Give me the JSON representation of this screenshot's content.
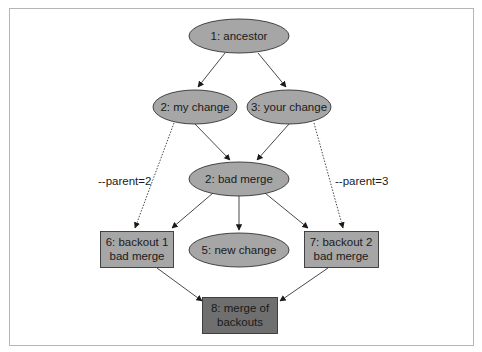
{
  "diagram": {
    "colors": {
      "node_fill": "#a6a6a6",
      "final_fill": "#6f6f6f",
      "stroke": "#333333",
      "frame": "#b5b5b5"
    },
    "nodes": {
      "n1": {
        "label": "1: ancestor",
        "shape": "ellipse"
      },
      "n2": {
        "label": "2: my change",
        "shape": "ellipse"
      },
      "n3": {
        "label": "3: your change",
        "shape": "ellipse"
      },
      "n4": {
        "label": "2: bad merge",
        "shape": "ellipse"
      },
      "n5": {
        "label": "5: new change",
        "shape": "ellipse"
      },
      "n6": {
        "line1": "6: backout 1",
        "line2": "bad merge",
        "shape": "box"
      },
      "n7": {
        "line1": "7: backout 2",
        "line2": "bad merge",
        "shape": "box"
      },
      "n8": {
        "line1": "8: merge of",
        "line2": "backouts",
        "shape": "box"
      }
    },
    "edge_labels": {
      "parent2": "--parent=2",
      "parent3": "--parent=3"
    },
    "edges": [
      {
        "from": "1: ancestor",
        "to": "2: my change",
        "style": "solid"
      },
      {
        "from": "1: ancestor",
        "to": "3: your change",
        "style": "solid"
      },
      {
        "from": "2: my change",
        "to": "2: bad merge",
        "style": "solid"
      },
      {
        "from": "3: your change",
        "to": "2: bad merge",
        "style": "solid"
      },
      {
        "from": "2: bad merge",
        "to": "6: backout 1 bad merge",
        "style": "solid"
      },
      {
        "from": "2: bad merge",
        "to": "5: new change",
        "style": "solid"
      },
      {
        "from": "2: bad merge",
        "to": "7: backout 2 bad merge",
        "style": "solid"
      },
      {
        "from": "2: my change",
        "to": "6: backout 1 bad merge",
        "style": "dotted",
        "label": "--parent=2"
      },
      {
        "from": "3: your change",
        "to": "7: backout 2 bad merge",
        "style": "dotted",
        "label": "--parent=3"
      },
      {
        "from": "6: backout 1 bad merge",
        "to": "8: merge of backouts",
        "style": "solid"
      },
      {
        "from": "7: backout 2 bad merge",
        "to": "8: merge of backouts",
        "style": "solid"
      }
    ]
  }
}
